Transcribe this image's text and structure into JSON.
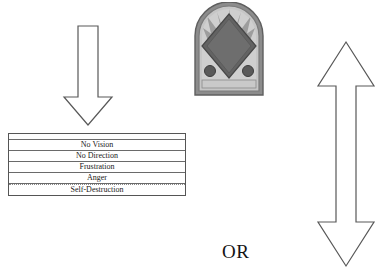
{
  "figure": {
    "background_color": "#ffffff",
    "line_color": "#555555",
    "text_color": "#1a1a1a"
  },
  "down_arrow": {
    "direction": "down",
    "fill": "#ffffff",
    "stroke": "#555555"
  },
  "emblem": {
    "shape": "arched-plaque-with-diamond",
    "frame_color": "#7a7a7a",
    "field_color": "#b9b9b9",
    "diamond_color": "#5d5d5d",
    "dot_color": "#4a4a4a"
  },
  "double_arrow": {
    "direction": "up-down",
    "fill": "#ffffff",
    "stroke": "#555555"
  },
  "or_label": {
    "text": "OR"
  },
  "stages_table": {
    "rows": [
      {
        "label": "No Vision"
      },
      {
        "label": "No Direction"
      },
      {
        "label": "Frustration"
      },
      {
        "label": "Anger"
      },
      {
        "label": "Self-Destruction"
      }
    ]
  }
}
